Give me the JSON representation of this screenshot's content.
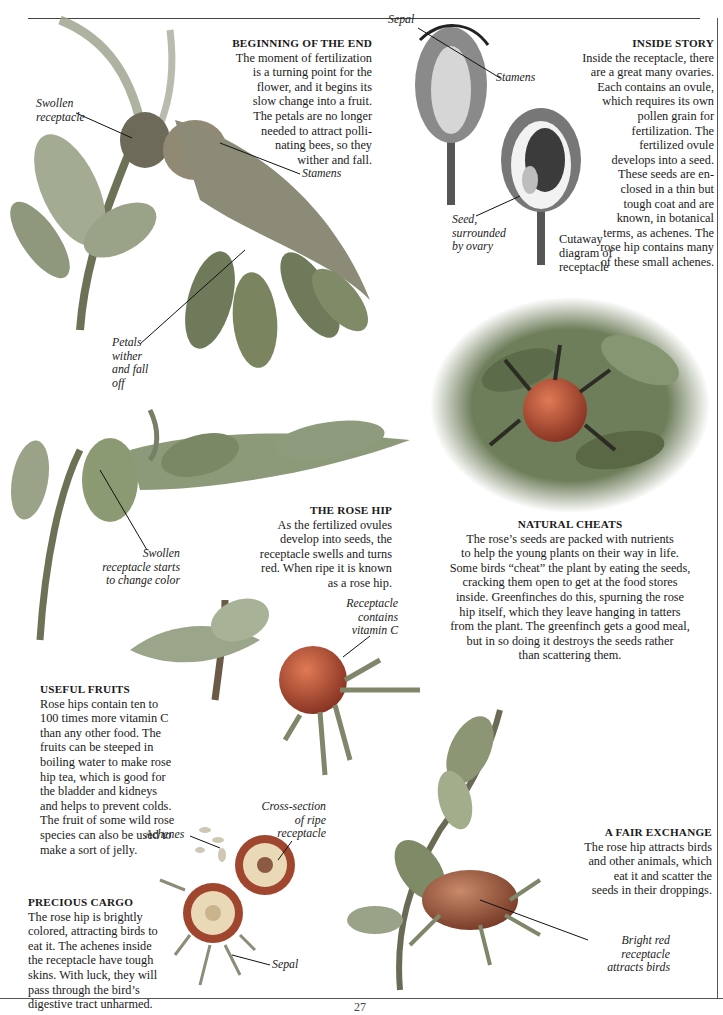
{
  "page": {
    "number": "27"
  },
  "sections": {
    "beginning": {
      "heading": "BEGINNING OF THE END",
      "lines": [
        "The moment of fertilization",
        "is a turning point for the",
        "flower, and it begins its",
        "slow change into a fruit.",
        "The petals are no longer",
        "needed to attract polli-",
        "nating bees, so they",
        "wither and fall."
      ]
    },
    "inside": {
      "heading": "INSIDE STORY",
      "lines": [
        "Inside the receptacle, there",
        "are a great many ovaries.",
        "Each contains an ovule,",
        "which requires its own",
        "pollen grain for",
        "fertilization. The",
        "fertilized ovule",
        "develops into a seed.",
        "These seeds are en-",
        "closed in a thin but",
        "tough coat and are",
        "known, in botanical",
        "terms, as  achenes. The",
        "rose hip contains many",
        "of these small achenes."
      ]
    },
    "rosehip": {
      "heading": "THE ROSE HIP",
      "lines": [
        "As the fertilized ovules",
        "develop into seeds, the",
        "receptacle swells and turns",
        "red. When ripe it is known",
        "as a rose hip."
      ]
    },
    "cheats": {
      "heading": "NATURAL CHEATS",
      "lines": [
        "The rose’s seeds are packed with nutrients",
        "to help the young plants on their way in life.",
        "Some birds “cheat” the plant by eating the seeds,",
        "cracking them open to get at the food stores",
        "inside. Greenfinches do this, spurning the rose",
        "hip itself, which they leave hanging in tatters",
        "from the plant. The greenfinch gets a good meal,",
        "but in so doing it destroys the seeds rather",
        "than scattering them."
      ]
    },
    "useful": {
      "heading": "USEFUL FRUITS",
      "lines": [
        "Rose hips contain ten to",
        "100 times more vitamin C",
        "than any other food. The",
        "fruits  can be steeped in",
        "boiling water to make rose",
        "hip tea, which is good for",
        "the bladder and kidneys",
        "and helps to prevent colds.",
        "The fruit of some wild rose",
        "species can also be used to",
        "make a sort of jelly."
      ]
    },
    "cargo": {
      "heading": "PRECIOUS CARGO",
      "lines": [
        "The rose hip is brightly",
        "colored, attracting birds to",
        "eat it. The achenes inside",
        "the receptacle have tough",
        "skins. With luck, they will",
        "pass through the bird’s",
        "digestive tract unharmed."
      ]
    },
    "exchange": {
      "heading": "A FAIR EXCHANGE",
      "lines": [
        "The rose hip attracts birds",
        "and other animals, which",
        "eat it and scatter the",
        "seeds in their droppings."
      ]
    }
  },
  "labels": {
    "swollen_receptacle": [
      "Swollen",
      "receptacle"
    ],
    "stamens_top": "Stamens",
    "petals_wither": [
      "Petals",
      "wither",
      "and fall",
      "off"
    ],
    "sepal_diagram": "Sepal",
    "stamens_diagram": "Stamens",
    "seed_surrounded": [
      "Seed,",
      "surrounded",
      "by ovary"
    ],
    "cutaway_caption": [
      "Cutaway",
      "diagram of",
      "receptacle"
    ],
    "swollen_change": [
      "Swollen",
      "receptacle starts",
      "to change color"
    ],
    "receptacle_vitc": [
      "Receptacle",
      "contains",
      "vitamin C"
    ],
    "achenes": "Achenes",
    "cross_section": [
      "Cross-section",
      "of ripe",
      "receptacle"
    ],
    "sepal_bottom": "Sepal",
    "bright_red": [
      "Bright red",
      "receptacle",
      "attracts birds"
    ],
    "diagram_marks": [
      "s",
      "s'",
      "e",
      "s",
      "fr",
      "a'"
    ]
  },
  "colors": {
    "text": "#1a1a1a",
    "rule": "#444444",
    "leaf": "#7f8d6a",
    "hip": "#b8553a",
    "hip_dark": "#8a3524",
    "flesh": "#e9d9b6"
  }
}
